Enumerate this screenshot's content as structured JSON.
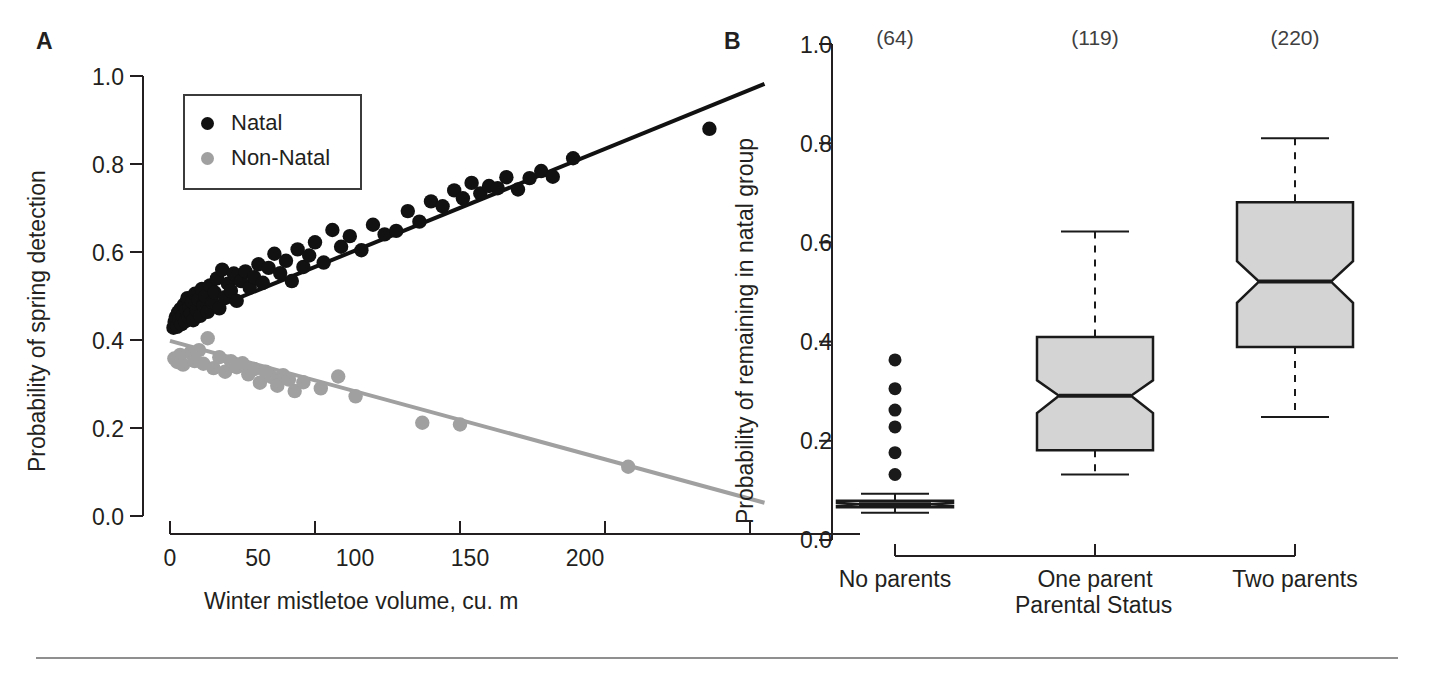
{
  "figure": {
    "background": "#ffffff",
    "ink": "#231f20",
    "natal_color": "#111111",
    "nonnatal_color": "#a0a0a0",
    "box_fill": "#d4d4d4",
    "box_stroke": "#1a1a1a",
    "rule_color": "#8f8f8f"
  },
  "panel_a": {
    "letter": "A",
    "legend": {
      "items": [
        {
          "label": "Natal",
          "color": "#111111",
          "marker": "filled-circle"
        },
        {
          "label": "Non-Natal",
          "color": "#a0a0a0",
          "marker": "filled-circle"
        }
      ]
    },
    "chart_data": {
      "type": "scatter",
      "title": "",
      "xlabel": "Winter mistletoe volume, cu. m",
      "ylabel": "Probability of spring detection",
      "xlim": [
        -12,
        212
      ],
      "ylim": [
        0.0,
        1.0
      ],
      "xticks": [
        0,
        50,
        100,
        150,
        200
      ],
      "xtick_labels": [
        "0",
        "50",
        "100",
        "150",
        "200"
      ],
      "yticks": [
        0.0,
        0.2,
        0.4,
        0.6,
        0.8,
        1.0
      ],
      "ytick_labels": [
        "0.0",
        "0.2",
        "0.4",
        "0.6",
        "0.8",
        "1.0"
      ],
      "grid": false,
      "legend_position": "upper-left-inside",
      "series": [
        {
          "name": "Natal",
          "color": "#111111",
          "marker": "filled-circle",
          "trendline": {
            "x": [
              0,
              205
            ],
            "y": [
              0.432,
              0.982
            ],
            "color": "#111111",
            "width": 4
          },
          "points": [
            [
              1.2,
              0.428
            ],
            [
              1.6,
              0.441
            ],
            [
              2.0,
              0.452
            ],
            [
              2.4,
              0.43
            ],
            [
              2.8,
              0.463
            ],
            [
              3.2,
              0.447
            ],
            [
              3.6,
              0.47
            ],
            [
              4.0,
              0.436
            ],
            [
              4.4,
              0.455
            ],
            [
              4.8,
              0.48
            ],
            [
              5.2,
              0.442
            ],
            [
              5.6,
              0.468
            ],
            [
              6.0,
              0.495
            ],
            [
              6.4,
              0.452
            ],
            [
              6.8,
              0.474
            ],
            [
              7.2,
              0.46
            ],
            [
              7.6,
              0.487
            ],
            [
              8.0,
              0.445
            ],
            [
              8.6,
              0.505
            ],
            [
              9.2,
              0.468
            ],
            [
              9.8,
              0.492
            ],
            [
              10.4,
              0.455
            ],
            [
              11.0,
              0.516
            ],
            [
              11.6,
              0.478
            ],
            [
              12.2,
              0.5
            ],
            [
              13.0,
              0.464
            ],
            [
              13.8,
              0.524
            ],
            [
              14.6,
              0.486
            ],
            [
              15.4,
              0.508
            ],
            [
              16.2,
              0.54
            ],
            [
              17.0,
              0.472
            ],
            [
              18.0,
              0.56
            ],
            [
              19.0,
              0.497
            ],
            [
              20.0,
              0.528
            ],
            [
              21.0,
              0.512
            ],
            [
              22.0,
              0.551
            ],
            [
              23.0,
              0.489
            ],
            [
              24.5,
              0.534
            ],
            [
              26.0,
              0.556
            ],
            [
              27.5,
              0.519
            ],
            [
              29.0,
              0.543
            ],
            [
              30.5,
              0.572
            ],
            [
              32.0,
              0.53
            ],
            [
              34.0,
              0.564
            ],
            [
              36.0,
              0.596
            ],
            [
              38.0,
              0.552
            ],
            [
              40.0,
              0.58
            ],
            [
              42.0,
              0.534
            ],
            [
              44.0,
              0.606
            ],
            [
              46.0,
              0.566
            ],
            [
              48.0,
              0.592
            ],
            [
              50.0,
              0.622
            ],
            [
              53.0,
              0.576
            ],
            [
              56.0,
              0.65
            ],
            [
              59.0,
              0.612
            ],
            [
              62.0,
              0.636
            ],
            [
              66.0,
              0.604
            ],
            [
              70.0,
              0.662
            ],
            [
              74.0,
              0.64
            ],
            [
              78.0,
              0.648
            ],
            [
              82.0,
              0.693
            ],
            [
              86.0,
              0.669
            ],
            [
              90.0,
              0.715
            ],
            [
              94.0,
              0.704
            ],
            [
              98.0,
              0.74
            ],
            [
              101.0,
              0.722
            ],
            [
              104.0,
              0.757
            ],
            [
              107.0,
              0.733
            ],
            [
              110.0,
              0.75
            ],
            [
              113.0,
              0.745
            ],
            [
              116.0,
              0.77
            ],
            [
              120.0,
              0.742
            ],
            [
              124.0,
              0.768
            ],
            [
              128.0,
              0.784
            ],
            [
              132.0,
              0.771
            ],
            [
              139.0,
              0.813
            ],
            [
              186.0,
              0.88
            ]
          ]
        },
        {
          "name": "Non-Natal",
          "color": "#a0a0a0",
          "marker": "filled-circle",
          "trendline": {
            "x": [
              0,
              205
            ],
            "y": [
              0.398,
              0.03
            ],
            "color": "#a0a0a0",
            "width": 4
          },
          "points": [
            [
              1.5,
              0.358
            ],
            [
              2.5,
              0.35
            ],
            [
              3.5,
              0.366
            ],
            [
              4.5,
              0.344
            ],
            [
              5.5,
              0.456
            ],
            [
              7.0,
              0.371
            ],
            [
              8.5,
              0.352
            ],
            [
              10.0,
              0.377
            ],
            [
              11.5,
              0.346
            ],
            [
              13.0,
              0.404
            ],
            [
              15.0,
              0.336
            ],
            [
              17.0,
              0.361
            ],
            [
              19.0,
              0.328
            ],
            [
              21.0,
              0.352
            ],
            [
              23.0,
              0.338
            ],
            [
              25.0,
              0.347
            ],
            [
              27.0,
              0.322
            ],
            [
              29.0,
              0.334
            ],
            [
              31.0,
              0.303
            ],
            [
              33.0,
              0.328
            ],
            [
              35.0,
              0.316
            ],
            [
              37.0,
              0.296
            ],
            [
              39.0,
              0.32
            ],
            [
              41.0,
              0.31
            ],
            [
              43.0,
              0.284
            ],
            [
              46.0,
              0.304
            ],
            [
              52.0,
              0.29
            ],
            [
              58.0,
              0.317
            ],
            [
              64.0,
              0.272
            ],
            [
              87.0,
              0.212
            ],
            [
              100.0,
              0.208
            ],
            [
              158.0,
              0.112
            ]
          ]
        }
      ]
    }
  },
  "panel_b": {
    "letter": "B",
    "chart_data": {
      "type": "boxplot",
      "title": "",
      "xlabel": "Parental Status",
      "ylabel": "Probability of remaining in natal group",
      "ylim": [
        0.0,
        1.0
      ],
      "yticks": [
        0.0,
        0.2,
        0.4,
        0.6,
        0.8,
        1.0
      ],
      "ytick_labels": [
        "0.0",
        "0.2",
        "0.4",
        "0.6",
        "0.8",
        "1.0"
      ],
      "grid": false,
      "notched": true,
      "categories": [
        "No parents",
        "One parent",
        "Two parents"
      ],
      "sample_size_labels": [
        "(64)",
        "(119)",
        "(220)"
      ],
      "boxes": [
        {
          "category": "No parents",
          "n": 64,
          "whisker_low": 0.055,
          "q1": 0.066,
          "median": 0.072,
          "q3": 0.079,
          "whisker_high": 0.093,
          "notch_low": 0.069,
          "notch_high": 0.075,
          "outliers": [
            0.132,
            0.176,
            0.228,
            0.262,
            0.305,
            0.363
          ]
        },
        {
          "category": "One parent",
          "n": 119,
          "whisker_low": 0.132,
          "q1": 0.181,
          "median": 0.291,
          "q3": 0.409,
          "whisker_high": 0.622,
          "notch_low": 0.256,
          "notch_high": 0.322,
          "outliers": []
        },
        {
          "category": "Two parents",
          "n": 220,
          "whisker_low": 0.248,
          "q1": 0.389,
          "median": 0.521,
          "q3": 0.681,
          "whisker_high": 0.81,
          "notch_low": 0.478,
          "notch_high": 0.562,
          "outliers": []
        }
      ]
    }
  }
}
